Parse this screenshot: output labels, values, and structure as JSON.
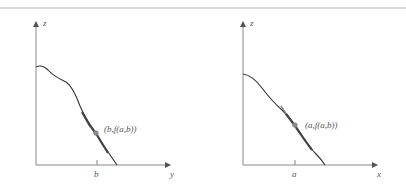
{
  "figure": {
    "left_panel": {
      "vertical_axis_label": "z",
      "horizontal_axis_label": "y",
      "tick_label": "b",
      "point_label": "(b,f(a,b))"
    },
    "right_panel": {
      "vertical_axis_label": "z",
      "horizontal_axis_label": "x",
      "tick_label": "a",
      "point_label": "(a,f(a,b))"
    },
    "colors": {
      "curve": "#333333",
      "axis": "#888888",
      "point": "#888888",
      "rule": "#d8d8d8"
    }
  }
}
